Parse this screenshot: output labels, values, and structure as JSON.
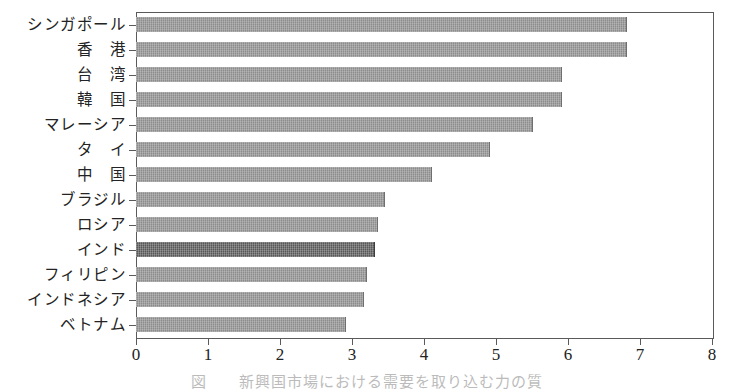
{
  "chart_data": {
    "type": "bar",
    "orientation": "horizontal",
    "title": "",
    "subtitle": "",
    "xlabel": "",
    "ylabel": "",
    "xlim": [
      0,
      8
    ],
    "xticks": [
      "0",
      "1",
      "2",
      "3",
      "4",
      "5",
      "6",
      "7",
      "8"
    ],
    "grid": false,
    "legend": null,
    "categories": [
      "シンガポール",
      "香　港",
      "台　湾",
      "韓　国",
      "マレーシア",
      "タ　イ",
      "中　国",
      "ブラジル",
      "ロシア",
      "インド",
      "フィリピン",
      "インドネシア",
      "ベトナム"
    ],
    "values": [
      6.8,
      6.8,
      5.9,
      5.9,
      5.5,
      4.9,
      4.1,
      3.45,
      3.35,
      3.3,
      3.2,
      3.15,
      2.9
    ],
    "highlighted_category": "インド",
    "colors": {
      "bar": "#8c8c8c",
      "bar_highlight": "#575757",
      "axis": "#5a5a5a",
      "text": "#232323"
    }
  },
  "caption": {
    "text": "図　　新興国市場における需要を取り込む力の質"
  }
}
